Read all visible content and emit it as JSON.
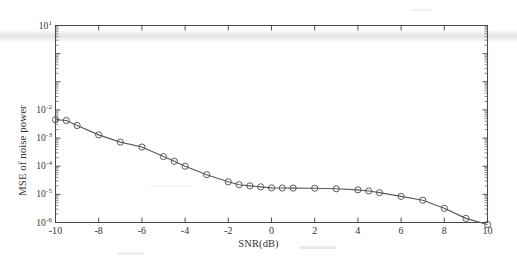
{
  "figure": {
    "background_color": "#ffffff",
    "ink_color": "#4a4843"
  },
  "chart_data": {
    "type": "line",
    "title": "",
    "xlabel": "SNR(dB)",
    "ylabel": "MSE of noise power",
    "yscale": "log",
    "xlim": [
      -10,
      10
    ],
    "ylim": [
      1e-06,
      10
    ],
    "grid": false,
    "legend": null,
    "marker": "circle",
    "series": [
      {
        "name": "MSE of noise power",
        "x": [
          -10,
          -9.5,
          -9,
          -8,
          -7,
          -6,
          -5,
          -4.5,
          -4,
          -3,
          -2,
          -1.5,
          -1,
          -0.5,
          0,
          0.5,
          1,
          2,
          3,
          4,
          4.5,
          5,
          6,
          7,
          8,
          9,
          10
        ],
        "values": [
          0.0045,
          0.0042,
          0.0028,
          0.0013,
          0.00072,
          0.00048,
          0.00022,
          0.00015,
          0.0001,
          5e-05,
          2.8e-05,
          2.2e-05,
          2e-05,
          1.85e-05,
          1.7e-05,
          1.68e-05,
          1.67e-05,
          1.65e-05,
          1.58e-05,
          1.45e-05,
          1.32e-05,
          1.15e-05,
          8.5e-06,
          6.2e-06,
          3.2e-06,
          1.4e-06,
          8.5e-07
        ]
      }
    ],
    "x_ticks": [
      -10,
      -8,
      -6,
      -4,
      -2,
      0,
      2,
      4,
      6,
      8,
      10
    ],
    "x_tick_labels": [
      "-10",
      "-8",
      "-6",
      "-4",
      "-2",
      "0",
      "2",
      "4",
      "6",
      "8",
      "10"
    ],
    "y_tick_exponents": [
      1,
      -2,
      -3,
      -4,
      -5,
      -6
    ],
    "y_tick_labels": [
      "10",
      "10",
      "10",
      "10",
      "10",
      "10"
    ],
    "y_tick_sups": [
      "1",
      "-2",
      "-3",
      "-4",
      "-5",
      "-6"
    ]
  }
}
